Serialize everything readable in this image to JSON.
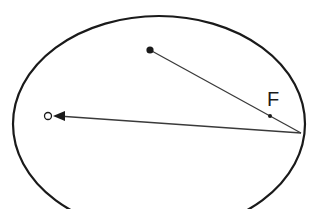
{
  "diagram": {
    "title": "",
    "colors": {
      "stroke": "#1a1a1a",
      "ray": "#3a3a3a",
      "background": "#ffffff"
    },
    "ellipse": {
      "cx": 159,
      "cy": 124,
      "rx": 146,
      "ry": 108
    },
    "source_point": {
      "x": 150,
      "y": 50,
      "r": 3.6,
      "filled": true
    },
    "reflection_point": {
      "x": 301,
      "y": 133
    },
    "focus_point": {
      "x": 270,
      "y": 116,
      "r": 2,
      "label": "F"
    },
    "focus_label": {
      "text": "F",
      "x": 267,
      "y": 106
    },
    "target_point": {
      "x": 48,
      "y": 116,
      "r": 3.5,
      "filled": false
    },
    "arrow": {
      "from": "reflection_point",
      "to": "target_point",
      "head": "filled-triangle"
    }
  }
}
